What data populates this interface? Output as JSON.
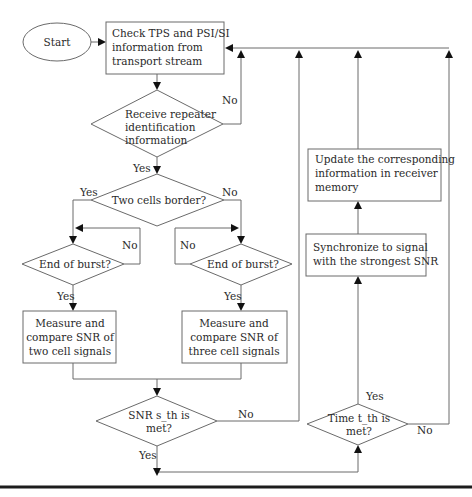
{
  "diagram": {
    "type": "flowchart",
    "nodes": {
      "start": {
        "label": "Start",
        "shape": "ellipse"
      },
      "check": {
        "label_lines": [
          "Check TPS and PSI/SI",
          "information from",
          "transport stream"
        ],
        "shape": "rect"
      },
      "receive": {
        "label_lines": [
          "Receive repeater",
          "identification",
          "information"
        ],
        "shape": "diamond"
      },
      "border": {
        "label": "Two cells border?",
        "shape": "diamond"
      },
      "burst_left": {
        "label": "End of burst?",
        "shape": "diamond"
      },
      "burst_right": {
        "label": "End of burst?",
        "shape": "diamond"
      },
      "measure_two": {
        "label_lines": [
          "Measure and",
          "compare SNR of",
          "two cell signals"
        ],
        "shape": "rect"
      },
      "measure_three": {
        "label_lines": [
          "Measure and",
          "compare SNR of",
          "three cell signals"
        ],
        "shape": "rect"
      },
      "snr": {
        "label_lines": [
          "SNR s_th is",
          "met?"
        ],
        "shape": "diamond"
      },
      "time": {
        "label_lines": [
          "Time t_th is",
          "met?"
        ],
        "shape": "diamond"
      },
      "sync": {
        "label_lines": [
          "Synchronize to signal",
          "with the strongest SNR"
        ],
        "shape": "rect"
      },
      "update": {
        "label_lines": [
          "Update the corresponding",
          "information in receiver",
          "memory"
        ],
        "shape": "rect"
      }
    },
    "edge_labels": {
      "receive_no": "No",
      "receive_yes": "Yes",
      "border_yes": "Yes",
      "border_no": "No",
      "burst_left_no": "No",
      "burst_left_yes": "Yes",
      "burst_right_no": "No",
      "burst_right_yes": "Yes",
      "snr_no": "No",
      "snr_yes": "Yes",
      "time_yes": "Yes",
      "time_no": "No"
    },
    "edges": [
      {
        "from": "start",
        "to": "check"
      },
      {
        "from": "check",
        "to": "receive"
      },
      {
        "from": "receive",
        "to": "check",
        "label": "No"
      },
      {
        "from": "receive",
        "to": "border",
        "label": "Yes"
      },
      {
        "from": "border",
        "to": "burst_left",
        "label": "Yes"
      },
      {
        "from": "border",
        "to": "burst_right",
        "label": "No"
      },
      {
        "from": "burst_left",
        "to": "burst_left",
        "label": "No"
      },
      {
        "from": "burst_right",
        "to": "burst_right",
        "label": "No"
      },
      {
        "from": "burst_left",
        "to": "measure_two",
        "label": "Yes"
      },
      {
        "from": "burst_right",
        "to": "measure_three",
        "label": "Yes"
      },
      {
        "from": "measure_two",
        "to": "snr"
      },
      {
        "from": "measure_three",
        "to": "snr"
      },
      {
        "from": "snr",
        "to": "check",
        "label": "No"
      },
      {
        "from": "snr",
        "to": "time",
        "label": "Yes"
      },
      {
        "from": "time",
        "to": "sync",
        "label": "Yes"
      },
      {
        "from": "time",
        "to": "check",
        "label": "No"
      },
      {
        "from": "sync",
        "to": "update"
      },
      {
        "from": "update",
        "to": "check"
      }
    ],
    "colors": {
      "line": "#6a6a6a",
      "arrowhead": "#111111",
      "text": "#2a2a2a",
      "rule": "#1c1c1c"
    }
  }
}
